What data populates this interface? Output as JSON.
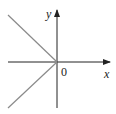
{
  "diagram": {
    "type": "function-graph",
    "axes": {
      "x_label": "x",
      "y_label": "y",
      "origin_label": "0",
      "axis_color": "#222222"
    },
    "curve": {
      "color": "#8a8a8a",
      "segments": [
        {
          "from": [
            0,
            0
          ],
          "to": [
            -1,
            1
          ]
        },
        {
          "from": [
            0,
            0
          ],
          "to": [
            -1,
            -1
          ]
        }
      ]
    }
  }
}
